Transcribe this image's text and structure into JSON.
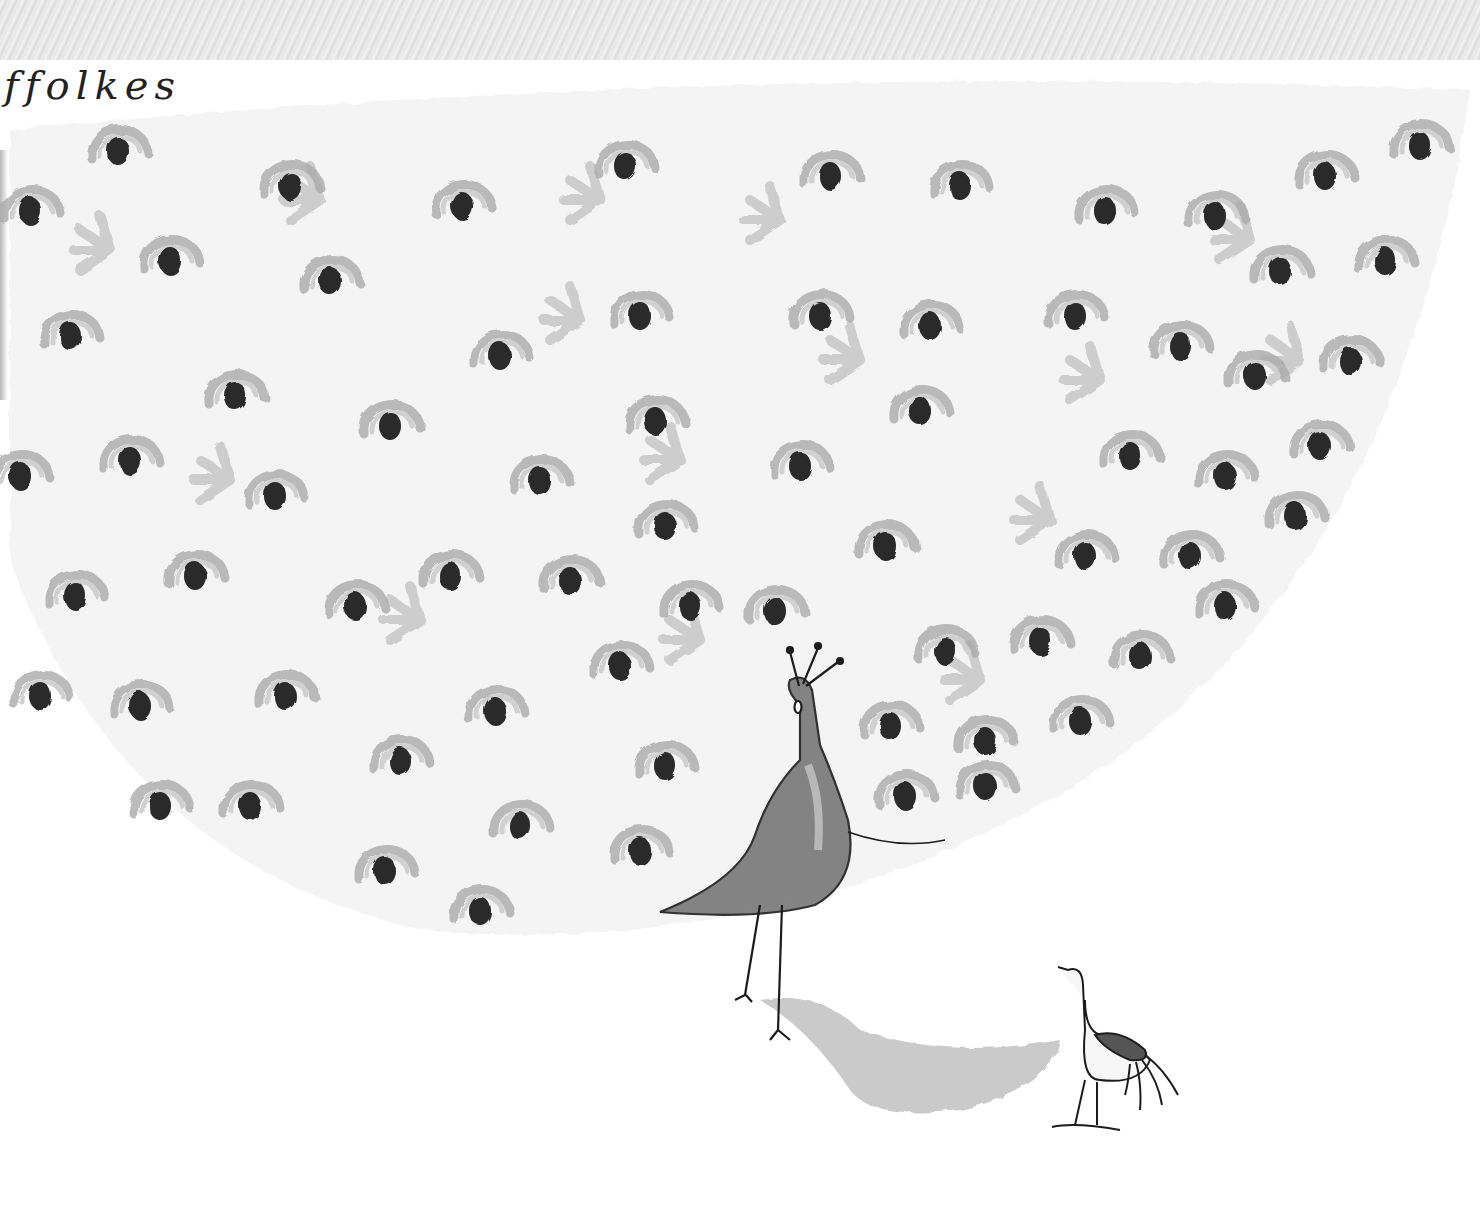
{
  "artwork": {
    "description": "Grayscale watercolor illustration of a peacock with its tail fully fanned out, dotted with eye-spots, displaying toward a small peahen",
    "signature": "ffolkes",
    "subjects": [
      "peacock",
      "peahen"
    ],
    "palette": {
      "paper": "#ffffff",
      "eye_spot": "#2a2a2a",
      "wash": "#b8b8b8",
      "light_wash": "#d8d8d8",
      "band": "#e6e6e6",
      "line": "#1c1c1c"
    }
  }
}
